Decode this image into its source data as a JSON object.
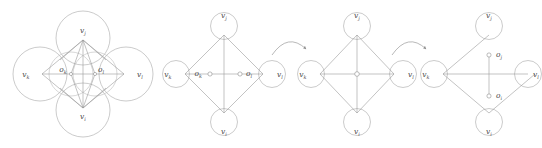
{
  "figure": {
    "stroke_color": "#9a9a9a",
    "text_color": "#4a4a4a",
    "background": "#ffffff",
    "panel_count": 4,
    "arrow_count": 2
  },
  "labels": {
    "v_j": "v",
    "v_i": "v",
    "v_k": "v",
    "v_l": "v",
    "o_k": "o",
    "o_l": "o",
    "o_j": "o",
    "o_i": "o",
    "sub_j": "j",
    "sub_i": "i",
    "sub_k": "k",
    "sub_l": "l"
  },
  "panels": [
    {
      "id": "panel-1",
      "name": "overlapping-circles-diamond",
      "vertices": [
        {
          "name": "v_j",
          "base": "v",
          "sub": "j",
          "position": "top"
        },
        {
          "name": "v_k",
          "base": "v",
          "sub": "k",
          "position": "left"
        },
        {
          "name": "v_l",
          "base": "v",
          "sub": "l",
          "position": "right"
        },
        {
          "name": "v_i",
          "base": "v",
          "sub": "i",
          "position": "bottom"
        }
      ],
      "center_nodes": [
        {
          "name": "o_k",
          "base": "o",
          "sub": "k",
          "position": "center-left"
        },
        {
          "name": "o_l",
          "base": "o",
          "sub": "l",
          "position": "center-right"
        }
      ],
      "circles": 6,
      "has_overlap": "true"
    },
    {
      "id": "panel-2",
      "name": "diamond-two-center-nodes-horizontal",
      "vertices": [
        {
          "name": "v_j",
          "base": "v",
          "sub": "j",
          "position": "top"
        },
        {
          "name": "v_k",
          "base": "v",
          "sub": "k",
          "position": "left"
        },
        {
          "name": "v_l",
          "base": "v",
          "sub": "l",
          "position": "right"
        },
        {
          "name": "v_i",
          "base": "v",
          "sub": "i",
          "position": "bottom"
        }
      ],
      "center_nodes": [
        {
          "name": "o_k",
          "base": "o",
          "sub": "k",
          "position": "center-left"
        },
        {
          "name": "o_l",
          "base": "o",
          "sub": "l",
          "position": "center-right"
        }
      ],
      "circles": 4,
      "has_overlap": "false"
    },
    {
      "id": "panel-3",
      "name": "diamond-single-merged-center-node",
      "vertices": [
        {
          "name": "v_j",
          "base": "v",
          "sub": "j",
          "position": "top"
        },
        {
          "name": "v_k",
          "base": "v",
          "sub": "k",
          "position": "left"
        },
        {
          "name": "v_l",
          "base": "v",
          "sub": "l",
          "position": "right"
        },
        {
          "name": "v_i",
          "base": "v",
          "sub": "i",
          "position": "bottom"
        }
      ],
      "center_nodes": [
        {
          "name": "o_center",
          "base": "",
          "sub": "",
          "position": "center"
        }
      ],
      "circles": 4,
      "has_overlap": "false"
    },
    {
      "id": "panel-4",
      "name": "diamond-two-center-nodes-vertical",
      "vertices": [
        {
          "name": "v_j",
          "base": "v",
          "sub": "j",
          "position": "top"
        },
        {
          "name": "v_k",
          "base": "v",
          "sub": "k",
          "position": "left"
        },
        {
          "name": "v_l",
          "base": "v",
          "sub": "l",
          "position": "right"
        },
        {
          "name": "v_i",
          "base": "v",
          "sub": "i",
          "position": "bottom"
        }
      ],
      "center_nodes": [
        {
          "name": "o_j",
          "base": "o",
          "sub": "j",
          "position": "center-upper"
        },
        {
          "name": "o_i",
          "base": "o",
          "sub": "i",
          "position": "center-lower"
        }
      ],
      "circles": 4,
      "has_overlap": "false"
    }
  ],
  "arrows": [
    {
      "id": "arrow-1",
      "name": "transition-arrow-1",
      "direction": "left-to-right"
    },
    {
      "id": "arrow-2",
      "name": "transition-arrow-2",
      "direction": "left-to-right"
    }
  ],
  "caption": {
    "text": ""
  }
}
